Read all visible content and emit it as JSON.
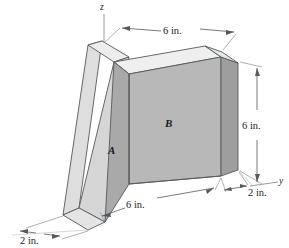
{
  "figure": {
    "axes": {
      "z_label": "z",
      "y_label": "y"
    },
    "face_labels": {
      "inclined": "A",
      "vertical": "B"
    },
    "dimensions": {
      "top_width": "6 in.",
      "right_height": "6 in.",
      "bottom_depth": "6 in.",
      "bottom_left_thickness": "2 in.",
      "bottom_right_thickness": "2 in."
    },
    "colors": {
      "outline": "#55595c",
      "top_face": "#eeeeee",
      "incline_face": "#dedede",
      "incline_side": "#d2d2d2",
      "front_face_b": "#b8b8b8",
      "front_face_a": "#ababab",
      "right_face": "#9e9e9e",
      "dim_line": "#7d8084",
      "background": "#ffffff"
    }
  }
}
